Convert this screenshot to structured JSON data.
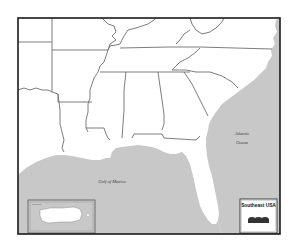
{
  "map": {
    "title": "Southeast USA",
    "water_labels": {
      "atlantic_line1": "Atlantic",
      "atlantic_line2": "Ocean",
      "gulf": "Gulf of Mexico"
    },
    "legend": {
      "title": "Southeast USA",
      "scale_label": "--- --- ---",
      "footer": "..."
    },
    "inset": {
      "title": "Puerto Rico",
      "caption": "..."
    },
    "colors": {
      "land": "#ffffff",
      "water": "#c8c8c8",
      "borders": "#6e6e6e",
      "frame": "#1a1a1a"
    }
  }
}
